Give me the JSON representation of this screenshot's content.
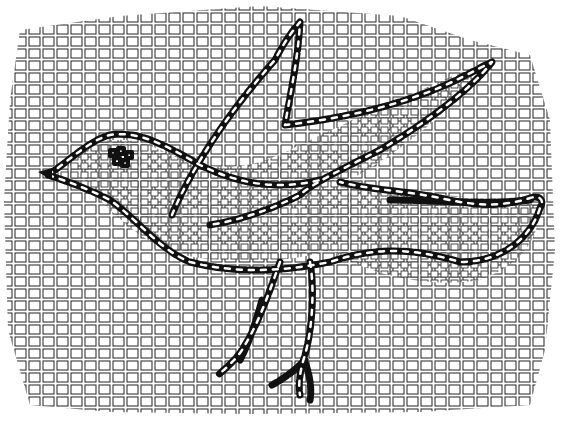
{
  "image": {
    "subject": "Line drawing of a mosaic depicting a bird in flight",
    "background_color": "#ffffff",
    "ink_color": "#111111",
    "tessera_outline_color": "#222222",
    "tessera_fill_color": "#ffffff",
    "outline_tessera_color": "#111111",
    "elements": [
      "mosaic-field",
      "bird-body-outline",
      "upper-wing-outline",
      "lower-wing-outline",
      "bird-head-and-beak",
      "eye-cluster",
      "left-leg",
      "right-leg"
    ]
  }
}
